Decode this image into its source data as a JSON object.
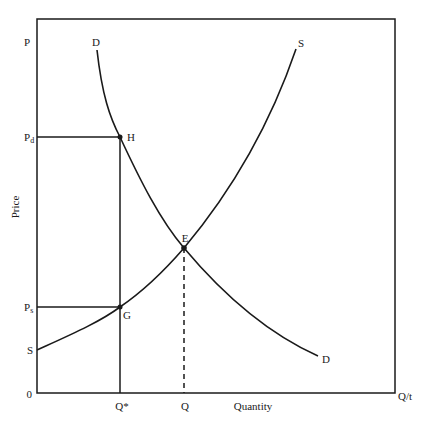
{
  "diagram": {
    "type": "supply-demand",
    "axes": {
      "y_label": "Price",
      "y_top_label": "P",
      "x_label": "Quantity",
      "x_end_label": "Q/t",
      "origin_label": "0"
    },
    "price_labels": {
      "pd": "P",
      "pd_sub": "d",
      "ps": "P",
      "ps_sub": "s"
    },
    "quantity_labels": {
      "q_star": "Q*",
      "q": "Q"
    },
    "curves": {
      "demand_top_label": "D",
      "demand_bottom_label": "D",
      "supply_top_label": "S",
      "supply_bottom_label": "S"
    },
    "points": {
      "h": "H",
      "e": "E",
      "g": "G"
    },
    "colors": {
      "line": "#1a1a1a",
      "background": "#ffffff"
    }
  }
}
